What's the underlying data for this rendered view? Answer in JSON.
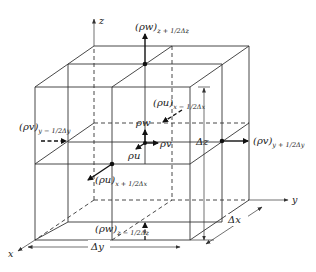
{
  "diagram": {
    "axes": {
      "x": "x",
      "y": "y",
      "z": "z"
    },
    "center_fluxes": {
      "u": "ρu",
      "v": "ρv",
      "w": "ρw"
    },
    "face_fluxes": {
      "w_top": {
        "base": "(ρw)",
        "sub": "z + 1/2Δz"
      },
      "w_bottom": {
        "base": "(ρw)",
        "sub": "z − 1/2Δz"
      },
      "u_back": {
        "base": "(ρu)",
        "sub": "x − 1/2Δx"
      },
      "u_front": {
        "base": "(ρu)",
        "sub": "x + 1/2Δx"
      },
      "v_left": {
        "base": "(ρv)",
        "sub": "y − 1/2Δy"
      },
      "v_right": {
        "base": "(ρv)",
        "sub": "y + 1/2Δy"
      }
    },
    "dimensions": {
      "dx": "Δx",
      "dy": "Δy",
      "dz": "Δz"
    },
    "colors": {
      "line": "#333333",
      "arrow": "#111111",
      "background": "#ffffff"
    }
  }
}
